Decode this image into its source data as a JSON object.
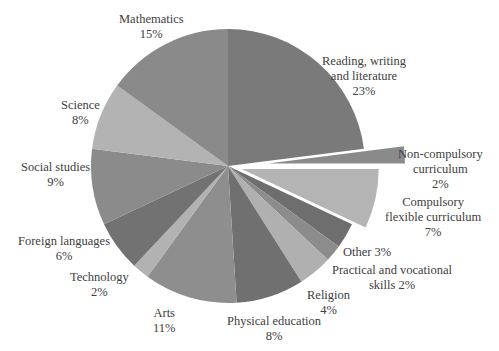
{
  "chart_data": {
    "type": "pie",
    "title": "",
    "start_angle_deg": 0,
    "direction": "clockwise",
    "center": [
      228,
      166
    ],
    "radius": 137,
    "slices": [
      {
        "label": "Reading, writing and literature",
        "value": 23,
        "pct_label": "23%",
        "color": "#7a7a7a",
        "explode": 0
      },
      {
        "label": "Non-compulsory curriculum",
        "value": 2,
        "pct_label": "2%",
        "color": "#8a8a8a",
        "explode": 40
      },
      {
        "label": "Compulsory flexible curriculum",
        "value": 7,
        "pct_label": "7%",
        "color": "#b4b4b4",
        "explode": 14
      },
      {
        "label": "Other",
        "value": 3,
        "pct_label": "3%",
        "color": "#6e6e6e",
        "explode": 0
      },
      {
        "label": "Practical and vocational skills",
        "value": 2,
        "pct_label": "2%",
        "color": "#8c8c8c",
        "explode": 0
      },
      {
        "label": "Religion",
        "value": 4,
        "pct_label": "4%",
        "color": "#b0b0b0",
        "explode": 0
      },
      {
        "label": "Physical education",
        "value": 8,
        "pct_label": "8%",
        "color": "#707070",
        "explode": 0
      },
      {
        "label": "Arts",
        "value": 11,
        "pct_label": "11%",
        "color": "#8e8e8e",
        "explode": 0
      },
      {
        "label": "Technology",
        "value": 2,
        "pct_label": "2%",
        "color": "#b2b2b2",
        "explode": 0
      },
      {
        "label": "Foreign languages",
        "value": 6,
        "pct_label": "6%",
        "color": "#727272",
        "explode": 0
      },
      {
        "label": "Social studies",
        "value": 9,
        "pct_label": "9%",
        "color": "#8b8b8b",
        "explode": 0
      },
      {
        "label": "Science",
        "value": 8,
        "pct_label": "8%",
        "color": "#b3b3b3",
        "explode": 0
      },
      {
        "label": "Mathematics",
        "value": 15,
        "pct_label": "15%",
        "color": "#8a8a8a",
        "explode": 0
      }
    ],
    "legend": "none",
    "data_labels": "outside"
  },
  "labels": {
    "reading": {
      "line1": "Reading, writing",
      "line2": "and literature",
      "pct": "23%"
    },
    "noncomp": {
      "line1": "Non-compulsory",
      "line2": "curriculum",
      "pct": "2%"
    },
    "compflex": {
      "line1": "Compulsory",
      "line2": "flexible curriculum",
      "pct": "7%"
    },
    "other": {
      "text": "Other 3%"
    },
    "practical": {
      "line1": "Practical and vocational",
      "line2": "skills 2%"
    },
    "religion": {
      "line1": "Religion",
      "pct": "4%"
    },
    "pe": {
      "line1": "Physical education",
      "pct": "8%"
    },
    "arts": {
      "line1": "Arts",
      "pct": "11%"
    },
    "technology": {
      "line1": "Technology",
      "pct": "2%"
    },
    "foreign": {
      "line1": "Foreign languages",
      "pct": "6%"
    },
    "social": {
      "line1": "Social studies",
      "pct": "9%"
    },
    "science": {
      "line1": "Science",
      "pct": "8%"
    },
    "math": {
      "line1": "Mathematics",
      "pct": "15%"
    }
  }
}
